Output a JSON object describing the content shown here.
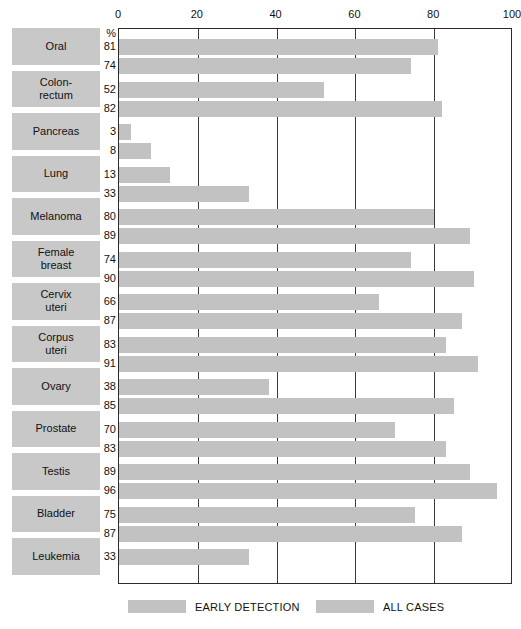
{
  "chart_data": {
    "type": "bar",
    "title": "",
    "subtitle": "",
    "xlabel": "%",
    "ylabel": "",
    "orientation": "horizontal",
    "xlim": [
      0,
      100
    ],
    "xticks": [
      0,
      20,
      40,
      60,
      80,
      100
    ],
    "xtick_labels": [
      "0",
      "20",
      "40",
      "60",
      "80",
      "100"
    ],
    "grid": true,
    "grid_axis": "x",
    "unit_label": "%",
    "legend_position": "bottom",
    "bar_color": "#c2c2c2",
    "label_box_color": "#c8c8c8",
    "axis_color": "#2b2b2b",
    "categories": [
      "Oral",
      "Colon-\nrectum",
      "Pancreas",
      "Lung",
      "Melanoma",
      "Female\nbreast",
      "Cervix\nuteri",
      "Corpus\nuteri",
      "Ovary",
      "Prostate",
      "Testis",
      "Bladder",
      "Leukemia"
    ],
    "series": [
      {
        "name": "EARLY DETECTION",
        "values": [
          81,
          52,
          3,
          13,
          80,
          74,
          66,
          83,
          38,
          70,
          89,
          75,
          33
        ]
      },
      {
        "name": "ALL CASES",
        "values": [
          74,
          82,
          8,
          33,
          89,
          90,
          87,
          91,
          85,
          83,
          96,
          87,
          null
        ]
      }
    ],
    "legend": [
      {
        "label": "EARLY DETECTION",
        "color": "#c2c2c2"
      },
      {
        "label": "ALL CASES",
        "color": "#c2c2c2"
      }
    ]
  }
}
